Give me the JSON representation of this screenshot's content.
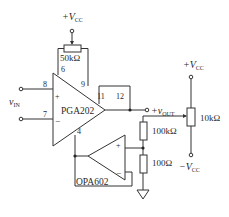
{
  "diagram": {
    "type": "circuit-schematic",
    "components": {
      "pga": {
        "name": "PGA202",
        "pins": {
          "noninv": "8",
          "inv": "7",
          "gain_adj_a": "6",
          "gain_adj_b": "9",
          "sense": "11",
          "out": "12",
          "ref": "4"
        },
        "plus": "+",
        "minus": "−"
      },
      "opamp": {
        "name": "OPA602",
        "plus": "+",
        "minus": "−"
      },
      "gain_pot": {
        "value": "50kΩ"
      },
      "offset_pot": {
        "value": "10kΩ"
      },
      "r1": {
        "value": "100kΩ"
      },
      "r2": {
        "value": "100Ω"
      }
    },
    "labels": {
      "vcc_top": "+V",
      "vcc_top_sub": "CC",
      "vcc_right": "+V",
      "vcc_right_sub": "CC",
      "vee_right": "−V",
      "vee_right_sub": "CC",
      "vin": "v",
      "vin_sub": "IN",
      "vout": "+v",
      "vout_sub": "OUT"
    }
  }
}
